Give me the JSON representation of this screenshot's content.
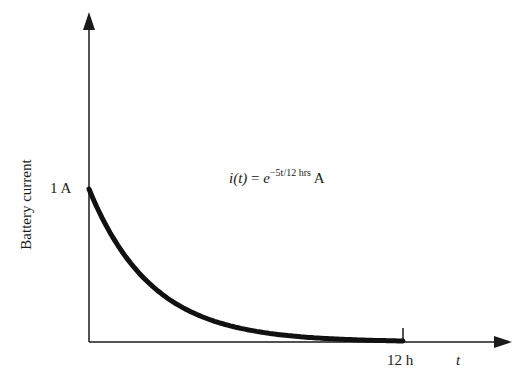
{
  "chart_data": {
    "type": "line",
    "title": "",
    "xlabel": "t",
    "ylabel": "Battery current",
    "x_tick_labels": [
      "12 h"
    ],
    "y_tick_labels": [
      "1 A"
    ],
    "annotation": {
      "lhs": "i(t)",
      "eq": " = ",
      "base": "e",
      "exponent": "−5t/12 hrs",
      "unit": " A"
    },
    "function": "i(t) = exp(-5t/12) A",
    "decay_constant_per_hour": 0.4167,
    "xlim": [
      0,
      12
    ],
    "ylim": [
      0,
      1
    ],
    "grid": false,
    "legend": false,
    "series": [
      {
        "name": "i(t)",
        "x": [
          0,
          1,
          2,
          3,
          4,
          5,
          6,
          7,
          8,
          9,
          10,
          11,
          12
        ],
        "values": [
          1.0,
          0.659,
          0.435,
          0.287,
          0.189,
          0.125,
          0.082,
          0.054,
          0.036,
          0.024,
          0.016,
          0.01,
          0.007
        ]
      }
    ],
    "colors": {
      "axis": "#1a1a1a",
      "curve": "#111111",
      "background": "#ffffff"
    }
  }
}
